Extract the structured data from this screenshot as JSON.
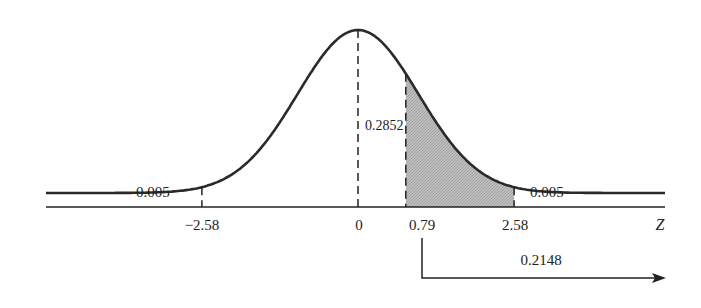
{
  "chart_data": {
    "type": "area",
    "title": "",
    "xlabel": "Z",
    "ylabel": "",
    "grid": false,
    "legend": null,
    "x_ticks": [
      "−2.58",
      "0",
      "0.79",
      "2.58"
    ],
    "x_tick_values": [
      -2.58,
      0,
      0.79,
      2.58
    ],
    "shaded_region": {
      "from": 0.79,
      "to": 2.58,
      "fill": "#b5b5b5"
    },
    "dashed_verticals": [
      -2.58,
      0,
      0.79,
      2.58
    ],
    "annotations": [
      {
        "text": "0.005",
        "position": "left tail, below z = -2.58"
      },
      {
        "text": "0.2852",
        "position": "between z = 0 and z = 0.79"
      },
      {
        "text": "0.005",
        "position": "right tail, above z = 2.58"
      },
      {
        "text": "0.2148",
        "position": "arrow from z = 0.79 extending right (area beyond 0.79)"
      }
    ],
    "areas": {
      "left_tail_below_-2.58": 0.005,
      "between_0_and_0.79": 0.2852,
      "right_tail_above_2.58": 0.005,
      "above_0.79": 0.2148
    }
  },
  "labels": {
    "left_tail": "0.005",
    "right_tail": "0.005",
    "center_area": "0.2852",
    "arrow_area": "0.2148",
    "tick_neg258": "−2.58",
    "tick_0": "0",
    "tick_079": "0.79",
    "tick_258": "2.58",
    "axis_label": "Z"
  },
  "colors": {
    "curve": "#2a2a2a",
    "shade": "#b5b5b5",
    "axis": "#222222"
  }
}
